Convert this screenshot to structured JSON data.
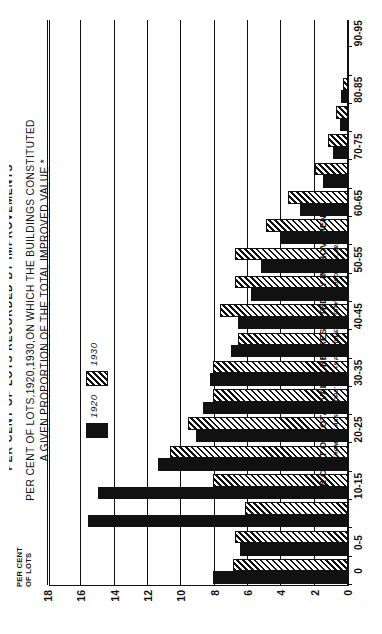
{
  "figure": {
    "cut_header": "PER CENT OF LOTS RECORDED BY IMPROVEMENTS",
    "title_line1": "PER CENT OF LOTS,1920,1930,ON WHICH THE BUILDINGS CONSTITUTED",
    "title_line2": "A GIVEN PROPORTION OF THE TOTAL IMPROVED VALUE *",
    "footnote": "* FROM TAX ASSESSORS' LIST AS PUBLISHED IN CITY RECORD, 1920, 1930"
  },
  "legend": {
    "items": [
      {
        "label": "1920",
        "swatch": "solid-black-swatch",
        "color": "#111111"
      },
      {
        "label": "1930",
        "swatch": "diagonal-hatch-swatch",
        "color": "#111111"
      }
    ]
  },
  "axes": {
    "y_title_line1": "PER CENT",
    "y_title_line2": "OF LOTS",
    "y_ticks": [
      "0",
      "2",
      "4",
      "6",
      "8",
      "10",
      "12",
      "14",
      "16",
      "18"
    ],
    "x_title": "PER CENT OF TOTAL VALUE REPRESENTED BY IMPROVEMENTS"
  },
  "chart_data": {
    "type": "bar",
    "title": "PER CENT OF LOTS,1920,1930,ON WHICH THE BUILDINGS CONSTITUTED A GIVEN PROPORTION OF THE TOTAL IMPROVED VALUE *",
    "xlabel": "PER CENT OF TOTAL VALUE REPRESENTED BY IMPROVEMENTS",
    "ylabel": "PER CENT OF LOTS",
    "ylim": [
      0,
      18
    ],
    "ytick_step": 2,
    "grid": true,
    "orientation": "vertical-bars-rotated-90ccw",
    "legend_position": "upper-center",
    "categories": [
      "0",
      "0-5",
      "5-10",
      "10-15",
      "15-20",
      "20-25",
      "25-30",
      "30-35",
      "35-40",
      "40-45",
      "45-50",
      "50-55",
      "55-60",
      "60-65",
      "65-70",
      "70-75",
      "75-80",
      "80-85",
      "85-90",
      "90-95"
    ],
    "tick_labels_shown": [
      "0",
      "0-5",
      "10-15",
      "20-25",
      "30-35",
      "40-45",
      "50-55",
      "60-65",
      "70-75",
      "80-85",
      "90-95"
    ],
    "series": [
      {
        "name": "1920",
        "color": "#111111",
        "fill": "solid",
        "values": [
          8.1,
          6.5,
          15.6,
          15.0,
          11.4,
          9.1,
          8.7,
          8.3,
          7.0,
          6.6,
          5.8,
          5.2,
          4.1,
          2.9,
          1.5,
          0.9,
          0.5,
          0.4,
          0.0,
          0.0
        ]
      },
      {
        "name": "1930",
        "color": "#111111",
        "fill": "diagonal-hatch",
        "values": [
          6.9,
          6.8,
          6.2,
          8.1,
          10.7,
          9.6,
          8.1,
          8.1,
          6.6,
          7.7,
          6.8,
          6.8,
          4.9,
          3.6,
          2.0,
          1.2,
          0.7,
          0.3,
          0.0,
          0.0
        ]
      }
    ]
  }
}
